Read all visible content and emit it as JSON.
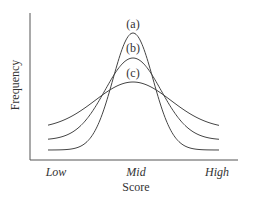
{
  "chart_data": {
    "type": "line",
    "title": "",
    "xlabel": "Score",
    "ylabel": "Frequency",
    "x_tick_labels": [
      "Low",
      "Mid",
      "High"
    ],
    "grid": false,
    "legend": "inline labels above peaks",
    "series": [
      {
        "name": "(a)",
        "label": "(a)",
        "peak_rel": 1.0,
        "tail_rel": 0.08,
        "spread": "narrow"
      },
      {
        "name": "(b)",
        "label": "(b)",
        "peak_rel": 0.8,
        "tail_rel": 0.17,
        "spread": "medium"
      },
      {
        "name": "(c)",
        "label": "(c)",
        "peak_rel": 0.6,
        "tail_rel": 0.26,
        "spread": "wide"
      }
    ]
  },
  "labels": {
    "a": "(a)",
    "b": "(b)",
    "c": "(c)",
    "low": "Low",
    "mid": "Mid",
    "high": "High",
    "xlabel": "Score",
    "ylabel": "Frequency"
  }
}
